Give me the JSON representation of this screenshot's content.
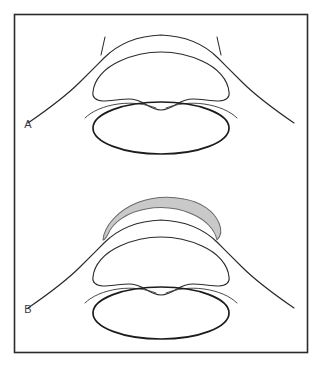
{
  "figure": {
    "background_color": "#ffffff",
    "border_color": "#2b2b2b",
    "line_color": "#2b2b2b",
    "thin_line_color": "#3f3f3f",
    "shade_fill_color": "#c9c9c9",
    "shade_stroke_color": "#6a6a6a",
    "label_color": "#3a3a3a"
  },
  "panels": [
    {
      "id": "panel-a",
      "label": "A",
      "description": "Normal axial vertebral cross-section with outer contour, paired tick marks, butterfly-shaped inner structure, lateral sweeps and vertebral body ellipse.",
      "has_shaded_lesion": false,
      "tick_marks": 2
    },
    {
      "id": "panel-b",
      "label": "B",
      "description": "Axial vertebral cross-section with a shaded crescent-shaped collection in the posterior canal region.",
      "has_shaded_lesion": true,
      "lesion_name": "crescent-shaped shaded collection",
      "lesion_fill": "#c9c9c9",
      "tick_marks": 0
    }
  ]
}
